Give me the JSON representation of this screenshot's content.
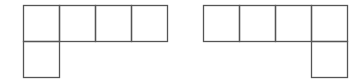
{
  "diagram": {
    "type": "cube-nets",
    "stroke_color": "#555555",
    "background": "#ffffff",
    "cell_size": 36,
    "figures": [
      {
        "name": "left-net",
        "cells": [
          {
            "col": 0,
            "row": 0
          },
          {
            "col": 1,
            "row": 0
          },
          {
            "col": 2,
            "row": 0
          },
          {
            "col": 3,
            "row": 0
          },
          {
            "col": 0,
            "row": 1
          }
        ],
        "origin": [
          23,
          5
        ]
      },
      {
        "name": "right-net",
        "cells": [
          {
            "col": 0,
            "row": 0
          },
          {
            "col": 1,
            "row": 0
          },
          {
            "col": 2,
            "row": 0
          },
          {
            "col": 3,
            "row": 0
          },
          {
            "col": 3,
            "row": 1
          }
        ],
        "origin": [
          203,
          5
        ]
      }
    ]
  }
}
